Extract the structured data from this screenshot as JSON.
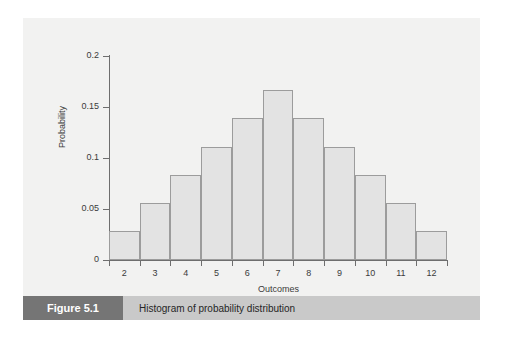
{
  "figure": {
    "tag": "Figure 5.1",
    "caption": "Histogram of probability distribution"
  },
  "colors": {
    "page_background": "#ffffff",
    "panel_background": "#f2f2f1",
    "bar_fill": "#e3e3e3",
    "bar_stroke": "#9c9c9c",
    "axis": "#6e6e6e",
    "caption_tag_background": "#757575",
    "caption_bar_background": "#c9c9c9",
    "text": "#3b3b3b"
  },
  "chart_data": {
    "type": "bar",
    "title": "",
    "xlabel": "Outcomes",
    "ylabel": "Probability",
    "categories": [
      "2",
      "3",
      "4",
      "5",
      "6",
      "7",
      "8",
      "9",
      "10",
      "11",
      "12"
    ],
    "values": [
      0.028,
      0.056,
      0.083,
      0.111,
      0.139,
      0.167,
      0.139,
      0.111,
      0.083,
      0.056,
      0.028
    ],
    "xlim": [
      1.5,
      12.5
    ],
    "ylim": [
      0,
      0.2
    ],
    "ytick_labels": [
      "0",
      "0.05",
      "0.1",
      "0.15",
      "0.2"
    ],
    "ytick_values": [
      0,
      0.05,
      0.1,
      0.15,
      0.2
    ],
    "xtick_labels": [
      "2",
      "3",
      "4",
      "5",
      "6",
      "7",
      "8",
      "9",
      "10",
      "11",
      "12"
    ],
    "grid": false,
    "legend": false
  }
}
